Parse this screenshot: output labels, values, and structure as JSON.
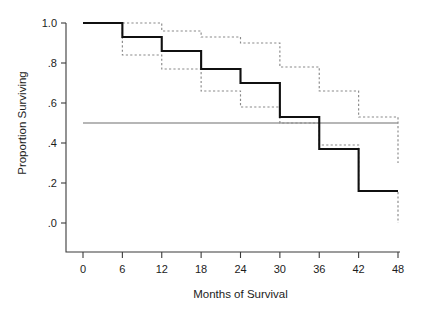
{
  "figure": {
    "background_color": "#ffffff",
    "main_curve_color": "#101010",
    "ci_curve_color": "#8a8a8a",
    "median_line_color": "#6f6f6f",
    "axis_color": "#3b3b3b"
  },
  "chart_data": {
    "type": "line",
    "title": "",
    "subtitle": "",
    "xlabel": "Months of Survival",
    "ylabel": "Proportion Surviving",
    "xlim": [
      0,
      48
    ],
    "ylim": [
      0.0,
      1.0
    ],
    "xticks": [
      0,
      6,
      12,
      18,
      24,
      30,
      36,
      42,
      48
    ],
    "xtick_labels": [
      "0",
      "6",
      "12",
      "18",
      "24",
      "30",
      "36",
      "42",
      "48"
    ],
    "yticks": [
      0.0,
      0.2,
      0.4,
      0.6,
      0.8,
      1.0
    ],
    "ytick_labels": [
      ".0",
      ".2",
      ".4",
      ".6",
      ".8",
      "1.0"
    ],
    "grid": false,
    "legend": null,
    "legend_position": "none",
    "step_style": "post",
    "annotations": [
      {
        "kind": "horizontal-reference-line",
        "label": "median survival reference at .5",
        "y": 0.5,
        "x_start": 0,
        "x_end": 48,
        "color": "#6f6f6f",
        "style": "solid"
      }
    ],
    "series": [
      {
        "name": "Survival estimate",
        "style": "solid",
        "color": "#101010",
        "x": [
          0,
          6,
          12,
          18,
          24,
          30,
          36,
          42,
          48
        ],
        "values": [
          1.0,
          0.93,
          0.86,
          0.77,
          0.7,
          0.53,
          0.37,
          0.16,
          0.16
        ]
      },
      {
        "name": "Upper 95% confidence limit",
        "style": "dashed",
        "color": "#8a8a8a",
        "x": [
          0,
          6,
          12,
          18,
          24,
          30,
          36,
          42,
          48
        ],
        "values": [
          1.0,
          1.0,
          0.96,
          0.93,
          0.9,
          0.78,
          0.66,
          0.53,
          0.3
        ]
      },
      {
        "name": "Lower 95% confidence limit",
        "style": "dashed",
        "color": "#8a8a8a",
        "x": [
          0,
          6,
          12,
          18,
          24,
          30,
          36,
          42,
          48
        ],
        "values": [
          1.0,
          0.84,
          0.77,
          0.66,
          0.58,
          0.5,
          0.39,
          0.16,
          0.0
        ]
      }
    ]
  }
}
